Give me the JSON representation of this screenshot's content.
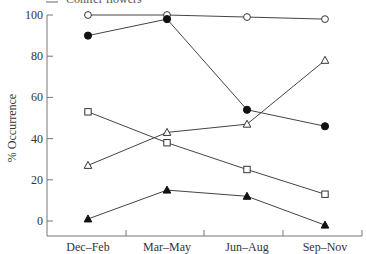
{
  "chart_data": {
    "type": "line",
    "title": "",
    "xlabel": "",
    "ylabel": "% Occurrence",
    "ylim": [
      -7,
      100
    ],
    "yticks": [
      0,
      20,
      40,
      60,
      80,
      100
    ],
    "grid": false,
    "legend_position": "top-left (cropped)",
    "visible_legend_entry": "Conifer flowers",
    "categories": [
      "Dec–Feb",
      "Mar–May",
      "Jun–Aug",
      "Sep–Nov"
    ],
    "series": [
      {
        "name": "open circles",
        "marker": "circle-open",
        "values": [
          100,
          100,
          99,
          98
        ]
      },
      {
        "name": "filled circles",
        "marker": "circle-filled",
        "values": [
          90,
          98,
          54,
          46
        ]
      },
      {
        "name": "open triangles",
        "marker": "triangle-open",
        "values": [
          27,
          43,
          47,
          78
        ]
      },
      {
        "name": "open squares",
        "marker": "square-open",
        "values": [
          53,
          38,
          25,
          13
        ]
      },
      {
        "name": "filled triangles",
        "marker": "triangle-filled",
        "values": [
          1,
          15,
          12,
          -2
        ]
      }
    ]
  },
  "legend": {
    "cropped_entry": "Conifer flowers"
  },
  "colors": {
    "line": "#444444",
    "axis": "#777777",
    "marker_fill": "#111111"
  }
}
